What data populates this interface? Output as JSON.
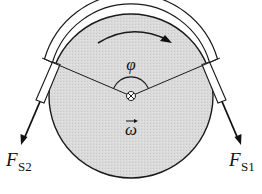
{
  "diagram": {
    "type": "belt-friction pulley (capstan) sketch",
    "labels": {
      "wrap_angle": "φ",
      "angular_velocity": "ω",
      "force_left_main": "F",
      "force_left_sub": "S2",
      "force_right_main": "F",
      "force_right_sub": "S1"
    },
    "colors": {
      "pulley_fill": "#d9d9d9",
      "stroke": "#1a1a1a",
      "rope_fill": "#ffffff",
      "background": "#ffffff"
    },
    "elements": [
      "pulley disk",
      "rope wrapped over top of pulley",
      "rotation direction arrow (clockwise)",
      "wrap angle arc φ",
      "axle symbol (circle with cross)",
      "angular velocity vector ω",
      "tension force arrow F_S2 (left, down-left)",
      "tension force arrow F_S1 (right, down-right)"
    ]
  }
}
